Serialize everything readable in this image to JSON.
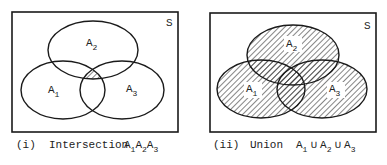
{
  "diagrams": [
    {
      "id": "intersection",
      "universe_label": "S",
      "sets": [
        {
          "name": "A",
          "sub": "1"
        },
        {
          "name": "A",
          "sub": "2"
        },
        {
          "name": "A",
          "sub": "3"
        }
      ],
      "shaded_region": "A1 ∩ A2 ∩ A3",
      "caption": {
        "index": "(i)",
        "text": "Intersection",
        "expr": [
          {
            "t": "A",
            "s": "1"
          },
          {
            "t": "A",
            "s": "2"
          },
          {
            "t": "A",
            "s": "3"
          }
        ]
      }
    },
    {
      "id": "union",
      "universe_label": "S",
      "sets": [
        {
          "name": "A",
          "sub": "1"
        },
        {
          "name": "A",
          "sub": "2"
        },
        {
          "name": "A",
          "sub": "3"
        }
      ],
      "shaded_region": "A1 ∪ A2 ∪ A3",
      "caption": {
        "index": "(ii)",
        "text": "Union",
        "expr": [
          {
            "t": "A",
            "s": "1"
          },
          {
            "op": "∪"
          },
          {
            "t": "A",
            "s": "2"
          },
          {
            "op": "∪"
          },
          {
            "t": "A",
            "s": "3"
          }
        ]
      }
    }
  ],
  "colors": {
    "stroke": "#1a1a1a",
    "hatch": "#333333",
    "background": "#ffffff"
  }
}
